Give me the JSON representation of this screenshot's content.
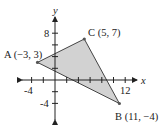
{
  "figure": {
    "axes": {
      "x_label": "x",
      "y_label": "y",
      "x_tick_labels": [
        "-4",
        "12"
      ],
      "y_tick_labels": [
        "8",
        "-4"
      ],
      "tick_spacing": 2
    },
    "points": [
      {
        "name": "A",
        "label": "A (−3, 3)",
        "x": -3,
        "y": 3
      },
      {
        "name": "B",
        "label": "B (11, −4)",
        "x": 11,
        "y": -4
      },
      {
        "name": "C",
        "label": "C (5, 7)",
        "x": 5,
        "y": 7
      }
    ],
    "shape": "triangle ABC (shaded)",
    "colors": {
      "fill": "#d2d2d2",
      "stroke": "#333333",
      "axis": "#222222"
    }
  }
}
